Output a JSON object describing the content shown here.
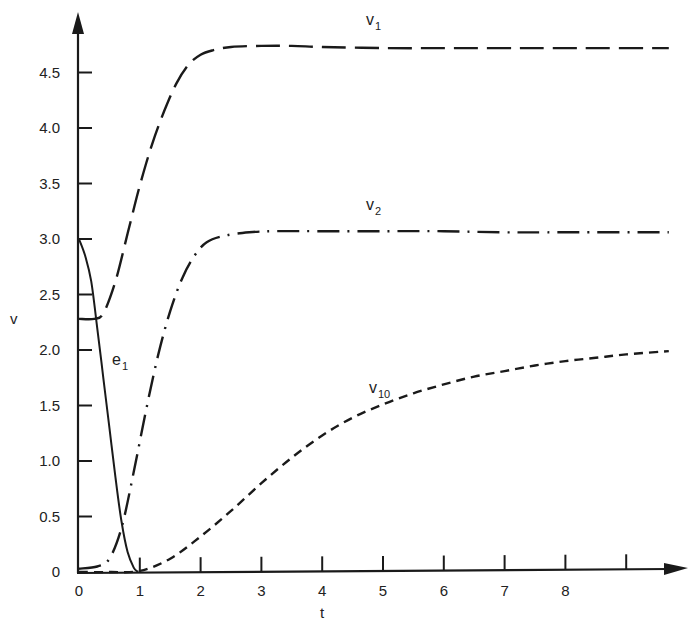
{
  "chart_data": {
    "type": "line",
    "title": "",
    "xlabel": "t",
    "ylabel": "v",
    "xlim": [
      0,
      9.7
    ],
    "ylim": [
      0,
      4.9
    ],
    "grid": false,
    "legend": "none (curves labeled inline)",
    "x_ticks": [
      "0",
      "1",
      "2",
      "3",
      "4",
      "5",
      "6",
      "7",
      "8",
      ""
    ],
    "x_tick_values": [
      0,
      1,
      2,
      3,
      4,
      5,
      6,
      7,
      8,
      9
    ],
    "y_ticks": [
      "0",
      "0.5",
      "1.0",
      "1.5",
      "2.0",
      "2.5",
      "3.0",
      "3.5",
      "4.0",
      "4.5"
    ],
    "y_tick_values": [
      0,
      0.5,
      1.0,
      1.5,
      2.0,
      2.5,
      3.0,
      3.5,
      4.0,
      4.5
    ],
    "series": [
      {
        "name": "v1",
        "label": "v",
        "label_sub": "1",
        "style": "long-dash",
        "x": [
          0,
          0.25,
          0.4,
          0.6,
          0.8,
          1.0,
          1.2,
          1.4,
          1.6,
          1.8,
          2.0,
          2.2,
          2.5,
          3.0,
          3.5,
          4.0,
          5.0,
          6.0,
          7.0,
          8.0,
          9.7
        ],
        "y": [
          2.28,
          2.28,
          2.33,
          2.62,
          3.05,
          3.48,
          3.85,
          4.15,
          4.4,
          4.57,
          4.66,
          4.7,
          4.73,
          4.74,
          4.74,
          4.73,
          4.72,
          4.72,
          4.72,
          4.72,
          4.72
        ]
      },
      {
        "name": "v2",
        "label": "v",
        "label_sub": "2",
        "style": "dash-dot",
        "x": [
          0,
          0.3,
          0.5,
          0.7,
          0.9,
          1.1,
          1.3,
          1.5,
          1.7,
          1.9,
          2.1,
          2.4,
          2.8,
          3.2,
          4.0,
          5.0,
          6.0,
          7.0,
          8.0,
          9.7
        ],
        "y": [
          0.03,
          0.05,
          0.12,
          0.4,
          0.9,
          1.45,
          1.95,
          2.35,
          2.65,
          2.85,
          2.97,
          3.03,
          3.06,
          3.07,
          3.07,
          3.07,
          3.07,
          3.06,
          3.06,
          3.06
        ]
      },
      {
        "name": "v10",
        "label": "v",
        "label_sub": "10",
        "style": "short-dash",
        "x": [
          0,
          0.5,
          1.0,
          1.5,
          2.0,
          2.5,
          3.0,
          3.5,
          4.0,
          4.5,
          5.0,
          5.5,
          6.0,
          6.5,
          7.0,
          7.5,
          8.0,
          8.5,
          9.0,
          9.7
        ],
        "y": [
          0.0,
          0.0,
          0.01,
          0.12,
          0.32,
          0.55,
          0.8,
          1.03,
          1.23,
          1.39,
          1.51,
          1.61,
          1.69,
          1.76,
          1.81,
          1.86,
          1.9,
          1.93,
          1.96,
          1.99
        ]
      },
      {
        "name": "e1",
        "label": "e",
        "label_sub": "1",
        "style": "solid",
        "x": [
          0,
          0.1,
          0.2,
          0.3,
          0.4,
          0.5,
          0.6,
          0.7,
          0.8,
          0.9,
          0.97
        ],
        "y": [
          3.0,
          2.85,
          2.62,
          2.2,
          1.75,
          1.3,
          0.85,
          0.45,
          0.18,
          0.04,
          0.0
        ]
      }
    ],
    "annotations": [
      {
        "text": "v1",
        "x": 4.7,
        "y": 4.95
      },
      {
        "text": "v2",
        "x": 4.7,
        "y": 3.3
      },
      {
        "text": "v10",
        "x": 4.7,
        "y": 1.55
      },
      {
        "text": "e1",
        "x": 0.6,
        "y": 1.95
      }
    ]
  },
  "axes": {
    "x_title": "t",
    "y_title": "v"
  },
  "labels": {
    "v1": {
      "main": "v",
      "sub": "1"
    },
    "v2": {
      "main": "v",
      "sub": "2"
    },
    "v10": {
      "main": "v",
      "sub": "10"
    },
    "e1": {
      "main": "e",
      "sub": "1"
    }
  },
  "colors": {
    "ink": "#1a1a1a",
    "background": "#ffffff"
  }
}
